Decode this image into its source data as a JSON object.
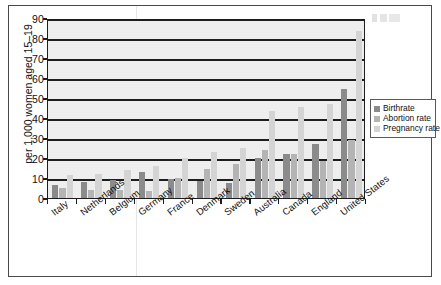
{
  "chart_data": {
    "type": "bar",
    "title": "",
    "subtitle": "",
    "xlabel": "",
    "ylabel": "per 1,000 women aged 15–19",
    "ylim": [
      0,
      90
    ],
    "ytick_labels": [
      "0",
      "10",
      "20",
      "30",
      "40",
      "50",
      "60",
      "70",
      "80",
      "90"
    ],
    "ytick_values": [
      0,
      10,
      20,
      30,
      40,
      50,
      60,
      70,
      80,
      90
    ],
    "grid": true,
    "legend_position": "right",
    "categories": [
      "Italy",
      "Netherlands",
      "Belgium",
      "Germany",
      "France",
      "Denmark",
      "Sweden",
      "Australia",
      "Canada",
      "England",
      "United States"
    ],
    "series": [
      {
        "name": "Birthrate",
        "color": "#8b8b8b",
        "values": [
          6.6,
          8.0,
          9.1,
          13.0,
          9.4,
          8.3,
          7.7,
          20.1,
          22.1,
          26.9,
          54.4
        ]
      },
      {
        "name": "Abortion rate",
        "color": "#b4b4b4",
        "values": [
          5.1,
          3.9,
          4.2,
          3.6,
          10.2,
          14.4,
          17.2,
          23.9,
          22.1,
          18.6,
          29.2
        ]
      },
      {
        "name": "Pregnancy rate",
        "color": "#d4d4d4",
        "values": [
          11.3,
          12.2,
          14.1,
          16.1,
          20.2,
          23.1,
          24.9,
          43.7,
          45.4,
          46.9,
          83.6
        ]
      }
    ]
  },
  "legend": {
    "items": [
      {
        "label": "Birthrate",
        "key": "birth"
      },
      {
        "label": "Abortion rate",
        "key": "abort"
      },
      {
        "label": "Pregnancy rate",
        "key": "preg"
      }
    ]
  }
}
